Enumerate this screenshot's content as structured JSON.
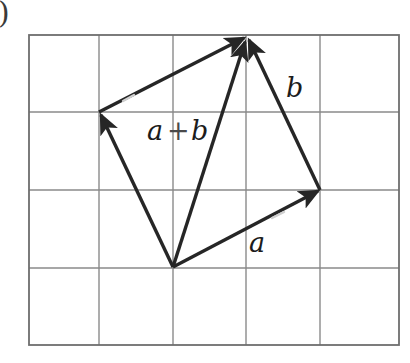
{
  "figure": {
    "marker_label": ")",
    "background_color": "#ffffff",
    "grid": {
      "line_color": "#8a8a8a",
      "border_color": "#6e6e6e",
      "left": 29,
      "top": 35,
      "right": 399,
      "bottom": 345,
      "columns": 5,
      "rows": 4,
      "x_lines": [
        29,
        99,
        173,
        246,
        320,
        399
      ],
      "y_lines": [
        35,
        112,
        190,
        268,
        345
      ]
    },
    "vector_color": "#262626",
    "points": {
      "origin": {
        "name": "tail",
        "x": 173,
        "y": 267
      },
      "a_tip": {
        "name": "a-endpoint",
        "x": 320,
        "y": 190
      },
      "b_tip": {
        "name": "b-endpoint",
        "x": 99,
        "y": 112
      },
      "sum_tip": {
        "name": "a-plus-b-endpoint",
        "x": 246,
        "y": 37
      }
    },
    "vectors": [
      {
        "id": "a",
        "label": "a",
        "from": "origin",
        "to": "a_tip",
        "label_x": 256,
        "label_y": 250
      },
      {
        "id": "b",
        "label": "b",
        "from": "a_tip",
        "to": "sum_tip",
        "label_x": 293,
        "label_y": 95
      },
      {
        "id": "b_from_origin",
        "label": "",
        "from": "origin",
        "to": "b_tip",
        "label_x": 0,
        "label_y": 0
      },
      {
        "id": "a_from_b",
        "label": "",
        "from": "b_tip",
        "to": "sum_tip",
        "label_x": 0,
        "label_y": 0
      },
      {
        "id": "sum",
        "label": "a + b",
        "from": "origin",
        "to": "sum_tip",
        "label_x": 148,
        "label_y": 139
      }
    ],
    "labels": {
      "a": "a",
      "b": "b",
      "sum_first": "a",
      "sum_plus": "+",
      "sum_second": "b"
    }
  }
}
